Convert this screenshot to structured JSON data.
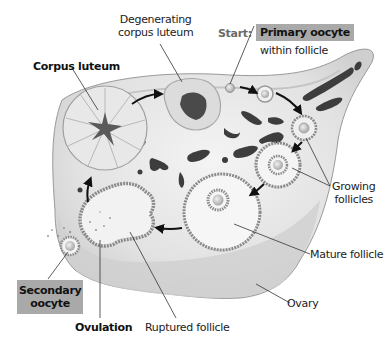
{
  "diagram": {
    "type": "ovarian-cycle",
    "labels": {
      "degenerating_corpus_luteum": "Degenerating\ncorpus luteum",
      "degenerating_line1": "Degenerating",
      "degenerating_line2": "corpus luteum",
      "start": "Start:",
      "primary_oocyte": "Primary oocyte",
      "within_follicle": "within follicle",
      "corpus_luteum": "Corpus luteum",
      "growing_line1": "Growing",
      "growing_line2": "follicles",
      "mature_follicle": "Mature follicle",
      "ovary": "Ovary",
      "secondary_line1": "Secondary",
      "secondary_line2": "oocyte",
      "ovulation": "Ovulation",
      "ruptured_follicle": "Ruptured follicle"
    },
    "sequence": [
      "Primary oocyte within follicle",
      "Growing follicles",
      "Mature follicle",
      "Ruptured follicle",
      "Ovulation / Secondary oocyte",
      "Corpus luteum",
      "Degenerating corpus luteum"
    ],
    "colors": {
      "label_box": "#a9a9a9",
      "ovary_fill": "#e6e6e6",
      "ovary_shadow": "#c8c8c8",
      "structure_dark": "#3a3a3a",
      "arrow": "#111111"
    }
  }
}
